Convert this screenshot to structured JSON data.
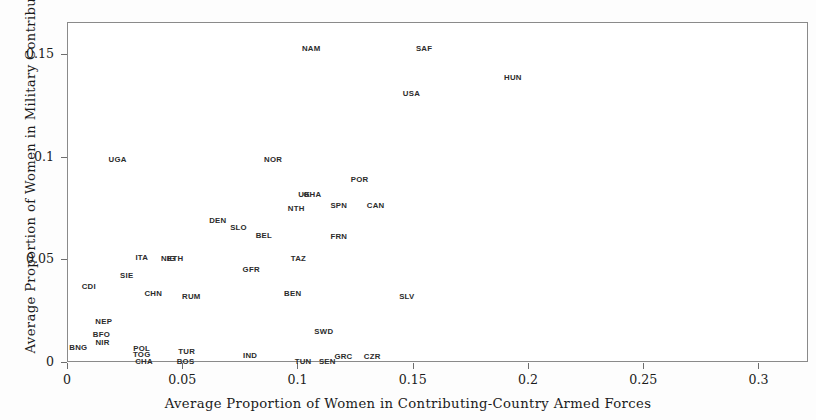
{
  "chart_data": {
    "type": "scatter",
    "title": "",
    "xlabel": "Average Proportion of Women in Contributing-Country Armed Forces",
    "ylabel": "Average Proportion of Women in Military Contributions",
    "xlim": [
      0,
      0.3215
    ],
    "ylim": [
      0,
      0.1655
    ],
    "grid": false,
    "legend": "none",
    "marker_style": "text-label-only",
    "xticks": [
      {
        "value": 0,
        "label": "0"
      },
      {
        "value": 0.05,
        "label": "0.05"
      },
      {
        "value": 0.1,
        "label": "0.1"
      },
      {
        "value": 0.15,
        "label": "0.15"
      },
      {
        "value": 0.2,
        "label": "0.2"
      },
      {
        "value": 0.25,
        "label": "0.25"
      },
      {
        "value": 0.3,
        "label": "0.3"
      }
    ],
    "yticks": [
      {
        "value": 0,
        "label": "0"
      },
      {
        "value": 0.05,
        "label": "0.05"
      },
      {
        "value": 0.1,
        "label": "0.1"
      },
      {
        "value": 0.15,
        "label": "0.15"
      }
    ],
    "points": [
      {
        "label": "NAM",
        "x": 0.1055,
        "y": 0.1528
      },
      {
        "label": "SAF",
        "x": 0.1545,
        "y": 0.1528
      },
      {
        "label": "HUN",
        "x": 0.193,
        "y": 0.1387
      },
      {
        "label": "USA",
        "x": 0.149,
        "y": 0.131
      },
      {
        "label": "UGA",
        "x": 0.0215,
        "y": 0.099
      },
      {
        "label": "NOR",
        "x": 0.089,
        "y": 0.099
      },
      {
        "label": "POR",
        "x": 0.1265,
        "y": 0.0893
      },
      {
        "label": "UK",
        "x": 0.1025,
        "y": 0.082
      },
      {
        "label": "GHA",
        "x": 0.106,
        "y": 0.082
      },
      {
        "label": "SPN",
        "x": 0.1175,
        "y": 0.0762
      },
      {
        "label": "CAN",
        "x": 0.1335,
        "y": 0.0762
      },
      {
        "label": "NTH",
        "x": 0.099,
        "y": 0.0752
      },
      {
        "label": "DEN",
        "x": 0.065,
        "y": 0.069
      },
      {
        "label": "SLO",
        "x": 0.074,
        "y": 0.0655
      },
      {
        "label": "BEL",
        "x": 0.085,
        "y": 0.062
      },
      {
        "label": "FRN",
        "x": 0.1175,
        "y": 0.0615
      },
      {
        "label": "ITA",
        "x": 0.032,
        "y": 0.051
      },
      {
        "label": "NIG",
        "x": 0.0435,
        "y": 0.0505
      },
      {
        "label": "ETH",
        "x": 0.0465,
        "y": 0.0505
      },
      {
        "label": "TAZ",
        "x": 0.1,
        "y": 0.0505
      },
      {
        "label": "GFR",
        "x": 0.0795,
        "y": 0.0452
      },
      {
        "label": "SIE",
        "x": 0.0255,
        "y": 0.0422
      },
      {
        "label": "CDI",
        "x": 0.009,
        "y": 0.0368
      },
      {
        "label": "CHN",
        "x": 0.037,
        "y": 0.0338
      },
      {
        "label": "RUM",
        "x": 0.0535,
        "y": 0.032
      },
      {
        "label": "BEN",
        "x": 0.0975,
        "y": 0.0338
      },
      {
        "label": "SLV",
        "x": 0.147,
        "y": 0.032
      },
      {
        "label": "NEP",
        "x": 0.0155,
        "y": 0.02
      },
      {
        "label": "BFO",
        "x": 0.0145,
        "y": 0.0135
      },
      {
        "label": "NIR",
        "x": 0.015,
        "y": 0.0095
      },
      {
        "label": "BNG",
        "x": 0.0045,
        "y": 0.0075
      },
      {
        "label": "SWD",
        "x": 0.111,
        "y": 0.015
      },
      {
        "label": "POL",
        "x": 0.032,
        "y": 0.007
      },
      {
        "label": "TOG",
        "x": 0.032,
        "y": 0.004
      },
      {
        "label": "CHA",
        "x": 0.033,
        "y": 0.0005
      },
      {
        "label": "TUR",
        "x": 0.0515,
        "y": 0.0055
      },
      {
        "label": "BOS",
        "x": 0.051,
        "y": 0.0005
      },
      {
        "label": "IND",
        "x": 0.079,
        "y": 0.0035
      },
      {
        "label": "TUN",
        "x": 0.102,
        "y": 0.0005
      },
      {
        "label": "SEN",
        "x": 0.1125,
        "y": 0.0005
      },
      {
        "label": "GRC",
        "x": 0.1195,
        "y": 0.003
      },
      {
        "label": "CZR",
        "x": 0.132,
        "y": 0.003
      }
    ]
  },
  "style": {
    "frame_color": "#8a8a8a",
    "text_color": "#1b1b1b",
    "point_label_color": "#2b2b2b",
    "background": "#ffffff"
  }
}
